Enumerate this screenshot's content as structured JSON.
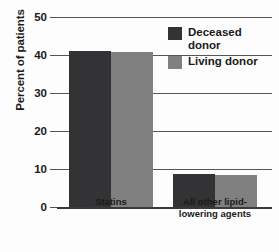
{
  "chart_data": {
    "type": "bar",
    "title": "",
    "xlabel": "",
    "ylabel": "Percent of patients",
    "ylim": [
      0,
      50
    ],
    "yticks": [
      0,
      10,
      20,
      30,
      40,
      50
    ],
    "ytick_labels": [
      "0",
      "10",
      "20",
      "30",
      "40",
      "50"
    ],
    "grid": true,
    "legend_position": "upper right",
    "categories": [
      "Statins",
      "All other lipid-lowering agents"
    ],
    "series": [
      {
        "name": "Deceased donor",
        "color": "#333335",
        "values": [
          41,
          8.8
        ]
      },
      {
        "name": "Living donor",
        "color": "#808080",
        "values": [
          40.7,
          8.4
        ]
      }
    ]
  },
  "axis": {
    "y_title": "Percent of patients"
  },
  "legend": {
    "items": [
      {
        "label": "Deceased\ndonor",
        "color": "#333335",
        "swatch_name": "legend-swatch-deceased-donor"
      },
      {
        "label": "Living donor",
        "color": "#808080",
        "swatch_name": "legend-swatch-living-donor"
      }
    ]
  },
  "x_labels": [
    {
      "text": "Statins"
    },
    {
      "text": "All other lipid-\nlowering agents"
    }
  ],
  "colors": {
    "deceased_donor": "#333335",
    "living_donor": "#808080",
    "gridline": "#555555",
    "text": "#1a1a1a",
    "background": "#fdfdfd"
  }
}
